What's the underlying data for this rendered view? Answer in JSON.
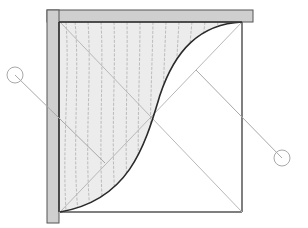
{
  "diagram": {
    "colors": {
      "background": "#ffffff",
      "frame_fill": "#cfcfcf",
      "frame_stroke": "#555555",
      "box_stroke": "#555555",
      "hatch_fill": "#ececec",
      "grain_stroke": "#9a9a9a",
      "curve_stroke": "#2a2a2a",
      "diagonal_stroke": "#b8b8b8",
      "callout_stroke": "#a8a8a8"
    },
    "frame": {
      "top_bar": {
        "x": 47,
        "y": 10,
        "w": 206,
        "h": 12
      },
      "left_bar": {
        "x": 47,
        "y": 10,
        "w": 12,
        "h": 213
      }
    },
    "box": {
      "x1": 60,
      "y1": 22,
      "x2": 242,
      "y2": 212
    },
    "curve": {
      "start": [
        60,
        212
      ],
      "end": [
        242,
        22
      ],
      "mid": [
        151,
        117
      ]
    },
    "diagonals": [
      {
        "from": [
          60,
          22
        ],
        "to": [
          242,
          212
        ]
      },
      {
        "from": [
          60,
          212
        ],
        "to": [
          242,
          22
        ]
      }
    ],
    "callouts": [
      {
        "id": "left-bubble",
        "center": [
          15,
          75
        ],
        "r": 8,
        "leader_to": [
          105,
          163
        ]
      },
      {
        "id": "right-bubble",
        "center": [
          282,
          158
        ],
        "r": 8,
        "leader_to": [
          196,
          70
        ]
      }
    ]
  }
}
